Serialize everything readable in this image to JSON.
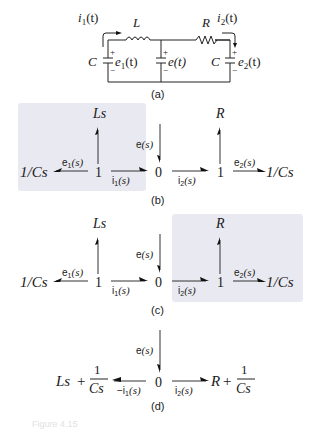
{
  "circuit": {
    "label": "(a)",
    "current_left": "i",
    "current_left_sub": "1",
    "current_left_arg": "(t)",
    "current_right": "i",
    "current_right_sub": "2",
    "current_right_arg": "(t)",
    "inductor": "L",
    "resistor": "R",
    "cap_left": "C",
    "cap_right": "C",
    "volt_left": "e",
    "volt_left_sub": "1",
    "volt_left_arg": "(t)",
    "volt_mid": "e(t)",
    "volt_right": "e",
    "volt_right_sub": "2",
    "volt_right_arg": "(t)",
    "plus": "+",
    "minus": "−"
  },
  "diagram_b": {
    "label": "(b)",
    "left_end": "1/Cs",
    "e1": "e",
    "e1_sub": "1",
    "e1_arg": "(s)",
    "junction1": "1",
    "top1": "Ls",
    "i1": "i",
    "i1_sub": "1",
    "i1_arg": "(s)",
    "source": "e(s)",
    "junction0": "0",
    "i2": "i",
    "i2_sub": "2",
    "i2_arg": "(s)",
    "junction1b": "1",
    "top2": "R",
    "e2": "e",
    "e2_sub": "2",
    "e2_arg": "(s)",
    "right_end": "1/Cs"
  },
  "diagram_c": {
    "label": "(c)",
    "left_end": "1/Cs",
    "e1": "e",
    "e1_sub": "1",
    "e1_arg": "(s)",
    "junction1": "1",
    "top1": "Ls",
    "i1": "i",
    "i1_sub": "1",
    "i1_arg": "(s)",
    "source": "e(s)",
    "junction0": "0",
    "i2": "i",
    "i2_sub": "2",
    "i2_arg": "(s)",
    "junction1b": "1",
    "top2": "R",
    "e2": "e",
    "e2_sub": "2",
    "e2_arg": "(s)",
    "right_end": "1/Cs"
  },
  "diagram_d": {
    "label": "(d)",
    "left_expr_a": "Ls",
    "plus": "+",
    "frac_num": "1",
    "frac_den": "Cs",
    "neg_i1": "−i",
    "neg_i1_sub": "1",
    "neg_i1_arg": "(s)",
    "source": "e(s)",
    "junction0": "0",
    "i2": "i",
    "i2_sub": "2",
    "i2_arg": "(s)",
    "right_expr_a": "R"
  },
  "caption": {
    "text": "Figure 4.15"
  }
}
